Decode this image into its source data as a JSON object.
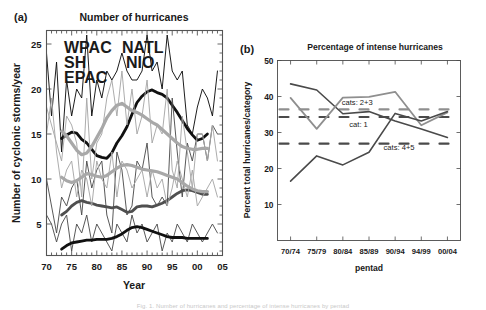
{
  "figure": {
    "caption_fragment": "Fig. 1. Number of hurricanes and percentage of intense hurricanes by pentad"
  },
  "panel_a": {
    "tag": "(a)",
    "title": "Number of hurricanes",
    "xlabel": "Year",
    "ylabel": "Number of cyclonic storms/year",
    "legend": [
      {
        "label": "WPAC",
        "color": "#111111"
      },
      {
        "label": "NATL",
        "color": "#4f4f4f"
      },
      {
        "label": "SH",
        "color": "#a8a8a8"
      },
      {
        "label": "NIO",
        "color": "#4f4f4f"
      },
      {
        "label": "EPAC",
        "color": "#a8a8a8"
      }
    ]
  },
  "panel_b": {
    "tag": "(b)",
    "title": "Percentage of intense hurricanes",
    "xlabel": "pentad",
    "ylabel": "Percent  total hurricanes/category"
  },
  "chart_data": [
    {
      "id": "panel-a",
      "type": "line",
      "title": "Number of hurricanes",
      "xlabel": "Year",
      "ylabel": "Number of cyclonic storms/year",
      "xlim": [
        1970,
        2005
      ],
      "ylim": [
        1.5,
        26.5
      ],
      "xticks": [
        1970,
        1975,
        1980,
        1985,
        1990,
        1995,
        2000,
        2005
      ],
      "xticklabels": [
        "70",
        "75",
        "80",
        "85",
        "90",
        "95",
        "00",
        "05"
      ],
      "yticks": [
        5,
        10,
        15,
        20,
        25
      ],
      "yticklabels": [
        "5",
        "10",
        "15",
        "20",
        "25"
      ],
      "minor_ticks": true,
      "grid": false,
      "legend_position": "upper-left-inside",
      "x": [
        1970,
        1971,
        1972,
        1973,
        1974,
        1975,
        1976,
        1977,
        1978,
        1979,
        1980,
        1981,
        1982,
        1983,
        1984,
        1985,
        1986,
        1987,
        1988,
        1989,
        1990,
        1991,
        1992,
        1993,
        1994,
        1995,
        1996,
        1997,
        1998,
        1999,
        2000,
        2001,
        2002,
        2003,
        2004
      ],
      "series": [
        {
          "name": "WPAC",
          "color": "#111111",
          "width": 1.0,
          "style": "thin",
          "values": [
            24,
            17,
            23,
            13,
            21,
            17,
            20,
            19,
            26,
            17,
            21,
            19,
            22,
            21,
            22,
            24,
            22,
            21,
            21,
            22,
            26,
            22,
            23,
            20,
            26,
            22,
            21,
            22,
            16,
            15,
            18,
            20,
            19,
            17,
            22
          ]
        },
        {
          "name": "WPAC-smooth",
          "color": "#111111",
          "width": 2.8,
          "style": "smooth",
          "values": [
            null,
            null,
            null,
            14.5,
            14.9,
            15.2,
            15.1,
            14.4,
            14.0,
            13.3,
            12.6,
            12.4,
            12.3,
            12.9,
            14.0,
            14.8,
            15.8,
            17.2,
            18.5,
            19.2,
            19.7,
            19.9,
            19.6,
            19.4,
            19.0,
            18.2,
            17.4,
            16.5,
            15.6,
            14.9,
            14.3,
            14.5,
            15.0,
            null,
            null
          ]
        },
        {
          "name": "NATL",
          "color": "#4f4f4f",
          "width": 1.0,
          "style": "thin",
          "values": [
            10,
            7,
            4,
            8,
            7,
            9,
            10,
            6,
            12,
            9,
            11,
            12,
            6,
            4,
            13,
            11,
            6,
            7,
            12,
            11,
            14,
            8,
            7,
            8,
            7,
            19,
            13,
            8,
            14,
            12,
            15,
            15,
            12,
            16,
            15
          ]
        },
        {
          "name": "NATL-smooth",
          "color": "#4f4f4f",
          "width": 2.8,
          "style": "smooth",
          "values": [
            null,
            null,
            null,
            6.0,
            6.4,
            7.0,
            7.4,
            7.6,
            7.4,
            7.3,
            7.1,
            7.0,
            6.9,
            6.8,
            6.9,
            6.6,
            6.3,
            6.4,
            6.9,
            7.0,
            7.0,
            6.9,
            7.1,
            7.3,
            7.6,
            8.0,
            8.4,
            8.7,
            8.8,
            8.7,
            8.5,
            8.3,
            8.3,
            null,
            null
          ]
        },
        {
          "name": "EPAC",
          "color": "#a8a8a8",
          "width": 1.0,
          "style": "thin",
          "values": [
            18,
            16,
            14,
            12,
            17,
            16,
            14,
            8,
            19,
            10,
            14,
            15,
            19,
            21,
            17,
            22,
            16,
            20,
            15,
            17,
            21,
            14,
            16,
            15,
            20,
            11,
            9,
            17,
            13,
            9,
            15,
            15,
            12,
            16,
            12
          ]
        },
        {
          "name": "EPAC-smooth",
          "color": "#a8a8a8",
          "width": 3.2,
          "style": "smooth",
          "values": [
            null,
            null,
            null,
            15.3,
            14.8,
            14.0,
            13.2,
            12.7,
            12.9,
            13.6,
            14.6,
            15.6,
            16.8,
            17.6,
            18.2,
            18.4,
            18.0,
            17.6,
            17.4,
            17.1,
            16.7,
            16.3,
            16.0,
            15.5,
            15.0,
            14.5,
            14.0,
            13.6,
            13.4,
            13.3,
            13.3,
            13.4,
            13.4,
            null,
            null
          ]
        },
        {
          "name": "SH",
          "color": "#a8a8a8",
          "width": 1.0,
          "style": "thin",
          "values": [
            15,
            19,
            13,
            9,
            11,
            12,
            8,
            11,
            10,
            7,
            12,
            10,
            9,
            13,
            8,
            12,
            11,
            9,
            10,
            11,
            8,
            11,
            9,
            10,
            7,
            9,
            12,
            10,
            8,
            11,
            7,
            8,
            9,
            10,
            8
          ]
        },
        {
          "name": "SH-smooth",
          "color": "#a8a8a8",
          "width": 3.2,
          "style": "smooth",
          "values": [
            null,
            null,
            null,
            10.2,
            9.8,
            9.6,
            9.8,
            10.2,
            10.6,
            10.5,
            10.3,
            10.2,
            10.4,
            10.8,
            11.2,
            11.5,
            11.6,
            11.5,
            11.3,
            11.1,
            11.0,
            10.9,
            10.8,
            10.6,
            10.4,
            10.2,
            10.0,
            9.6,
            9.2,
            8.9,
            8.7,
            8.6,
            8.6,
            null,
            null
          ]
        },
        {
          "name": "NIO",
          "color": "#4f4f4f",
          "width": 1.0,
          "style": "thin",
          "values": [
            6,
            5,
            3,
            5,
            6,
            2,
            5,
            4,
            6,
            3,
            5,
            4,
            3,
            2,
            5,
            4,
            3,
            6,
            4,
            5,
            3,
            4,
            5,
            2,
            4,
            3,
            5,
            4,
            3,
            5,
            4,
            3,
            4,
            5,
            4
          ]
        },
        {
          "name": "NIO-smooth",
          "color": "#111111",
          "width": 2.8,
          "style": "smooth",
          "values": [
            null,
            null,
            null,
            2.2,
            2.6,
            2.9,
            3.0,
            3.1,
            3.2,
            3.2,
            3.3,
            3.3,
            3.3,
            3.4,
            3.6,
            3.9,
            4.3,
            4.6,
            4.7,
            4.6,
            4.4,
            4.2,
            4.0,
            3.8,
            3.6,
            3.5,
            3.5,
            3.5,
            3.4,
            3.4,
            3.4,
            3.4,
            3.4,
            null,
            null
          ]
        }
      ]
    },
    {
      "id": "panel-b",
      "type": "line",
      "title": "Percentage of intense hurricanes",
      "xlabel": "pentad",
      "ylabel": "Percent  total hurricanes/category",
      "ylim": [
        0,
        50
      ],
      "yticks": [
        10,
        20,
        30,
        40,
        50
      ],
      "yticklabels": [
        "10",
        "20",
        "30",
        "40",
        "50"
      ],
      "categories": [
        "70/74",
        "75/79",
        "80/84",
        "85/89",
        "90/94",
        "94/99",
        "00/04"
      ],
      "grid": false,
      "series": [
        {
          "name": "cat: 1",
          "annotation": "cat: 1",
          "color": "#4a4a4a",
          "width": 1.6,
          "style": "solid",
          "values": [
            43.5,
            41.8,
            35.2,
            35.8,
            33.2,
            31.0,
            28.6
          ],
          "reference_line": 34.3,
          "reference_color": "#4a4a4a"
        },
        {
          "name": "cats: 2+3",
          "annotation": "cats: 2+3",
          "color": "#8f8f8f",
          "width": 1.8,
          "style": "solid",
          "values": [
            39.6,
            31.0,
            39.7,
            39.9,
            41.3,
            32.0,
            35.6
          ],
          "reference_line": 36.4,
          "reference_color": "#8f8f8f"
        },
        {
          "name": "cats: 4+5",
          "annotation": "cats: 4+5",
          "color": "#4a4a4a",
          "width": 1.6,
          "style": "solid",
          "values": [
            16.5,
            23.5,
            21.0,
            24.5,
            35.3,
            33.2,
            35.8
          ],
          "reference_line": 26.9,
          "reference_color": "#4a4a4a"
        }
      ]
    }
  ]
}
